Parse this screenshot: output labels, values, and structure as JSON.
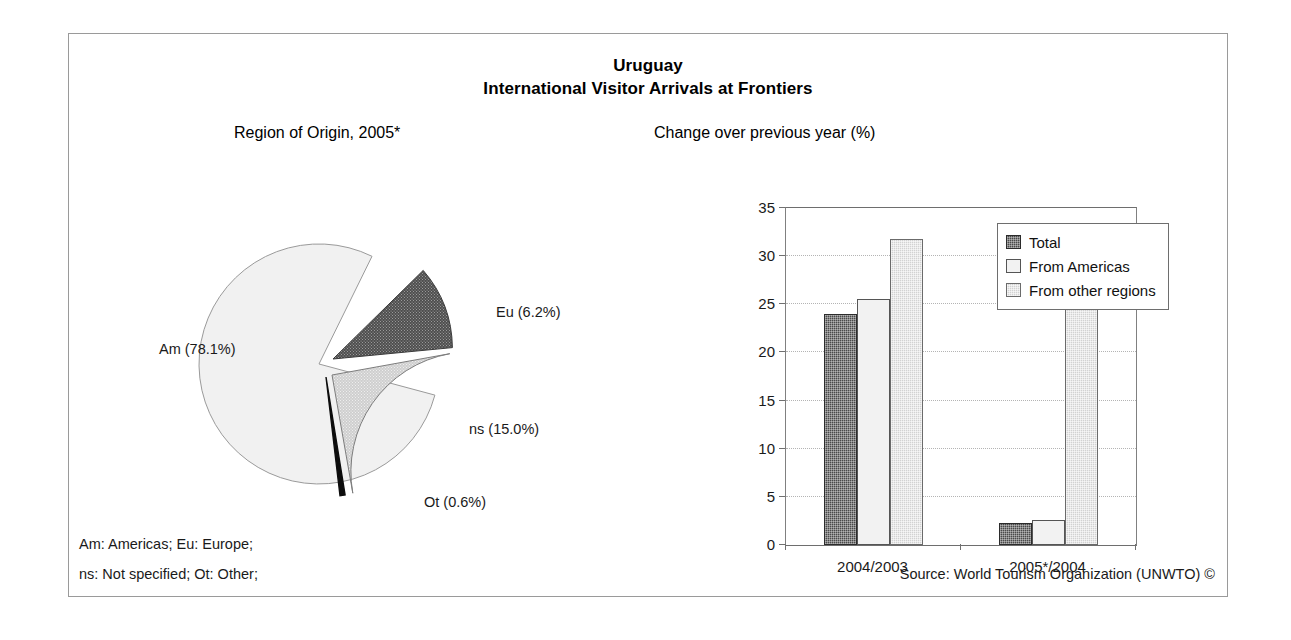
{
  "figure": {
    "title_country": "Uruguay",
    "title_subject": "International Visitor Arrivals at Frontiers",
    "pie_panel_title": "Region of Origin, 2005*",
    "bar_panel_title": "Change over previous year (%)",
    "footnote_line1": "Am: Americas; Eu: Europe;",
    "footnote_line2": "ns: Not specified; Ot: Other;",
    "source": "Source: World Tourism Organization (UNWTO) ©"
  },
  "chart_data": [
    {
      "type": "pie",
      "title": "Region of Origin, 2005*",
      "labels": [
        "Am",
        "Eu",
        "ns",
        "Ot"
      ],
      "label_texts": [
        "Am (78.1%)",
        "Eu (6.2%)",
        "ns (15.0%)",
        "Ot (0.6%)"
      ],
      "values": [
        78.1,
        6.2,
        15.0,
        0.6
      ],
      "units": "percent",
      "exploded": [
        false,
        true,
        true,
        true
      ],
      "colors": [
        "#f0f0f0",
        "#5a5a5a",
        "#c8c8c8",
        "#101010"
      ]
    },
    {
      "type": "bar",
      "title": "Change over previous year (%)",
      "categories": [
        "2004/2003",
        "2005*/2004"
      ],
      "series": [
        {
          "name": "Total",
          "values": [
            24.0,
            2.3
          ],
          "color": "#4a4a4a"
        },
        {
          "name": "From Americas",
          "values": [
            25.5,
            2.6
          ],
          "color": "#f2f2f2"
        },
        {
          "name": "From other regions",
          "values": [
            31.8,
            25.0
          ],
          "color": "#d2d2d2"
        }
      ],
      "xlabel": "",
      "ylabel": "",
      "ylim": [
        0,
        35
      ],
      "yticks": [
        0,
        5,
        10,
        15,
        20,
        25,
        30,
        35
      ],
      "grid": true,
      "legend_position": "top-right"
    }
  ]
}
